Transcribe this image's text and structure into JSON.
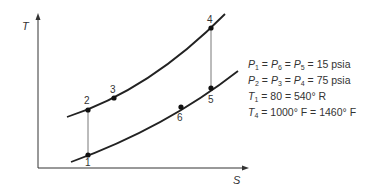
{
  "diagram": {
    "axes": {
      "y_label": "T",
      "x_label": "S"
    },
    "curves": [
      {
        "name": "high-pressure-isobar",
        "pressure": "75 psia"
      },
      {
        "name": "low-pressure-isobar",
        "pressure": "15 psia"
      }
    ],
    "points": [
      {
        "id": "1",
        "label": "1"
      },
      {
        "id": "2",
        "label": "2"
      },
      {
        "id": "3",
        "label": "3"
      },
      {
        "id": "4",
        "label": "4"
      },
      {
        "id": "5",
        "label": "5"
      },
      {
        "id": "6",
        "label": "6"
      }
    ],
    "conditions": [
      {
        "lhs": "P1 = P6 = P5",
        "rhs": "15 psia"
      },
      {
        "lhs": "P2 = P3 = P4",
        "rhs": "75 psia"
      },
      {
        "lhs": "T1",
        "rhs": "80 = 540° R"
      },
      {
        "lhs": "T4",
        "rhs": "1000° F = 1460° F"
      }
    ]
  }
}
